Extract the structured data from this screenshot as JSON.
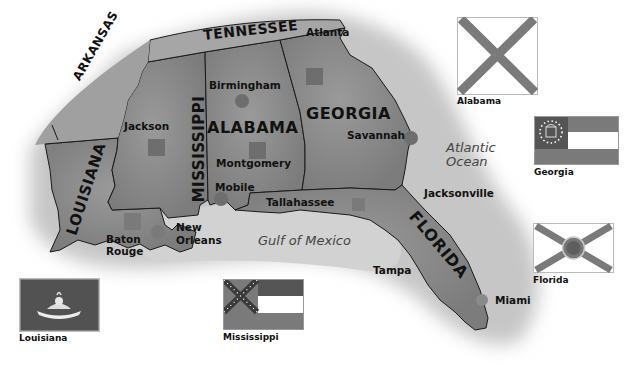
{
  "map": {
    "colors": {
      "land": "#8a8a8a",
      "land_light": "#b8b8b8",
      "border": "#1a1a1a",
      "marker": "#6e6e6e",
      "background": "#ffffff"
    },
    "states": [
      {
        "name": "TENNESSEE"
      },
      {
        "name": "ARKANSAS"
      },
      {
        "name": "MISSISSIPPI"
      },
      {
        "name": "ALABAMA"
      },
      {
        "name": "GEORGIA"
      },
      {
        "name": "LOUISIANA"
      },
      {
        "name": "FLORIDA"
      }
    ],
    "cities": [
      {
        "name": "Atlanta",
        "marker": "capital-square"
      },
      {
        "name": "Birmingham",
        "marker": "city-circle"
      },
      {
        "name": "Jackson",
        "marker": "capital-square"
      },
      {
        "name": "Savannah",
        "marker": "city-circle"
      },
      {
        "name": "Montgomery",
        "marker": "capital-square"
      },
      {
        "name": "Mobile",
        "marker": "city-circle"
      },
      {
        "name": "Tallahassee",
        "marker": "capital-square"
      },
      {
        "name": "Jacksonville",
        "marker": "none"
      },
      {
        "name": "Baton Rouge",
        "line1": "Baton",
        "line2": "Rouge",
        "marker": "capital-square"
      },
      {
        "name": "New Orleans",
        "line1": "New",
        "line2": "Orleans",
        "marker": "city-circle"
      },
      {
        "name": "Tampa",
        "marker": "none"
      },
      {
        "name": "Miami",
        "marker": "city-circle"
      }
    ],
    "water": [
      {
        "name": "Atlantic Ocean",
        "line1": "Atlantic",
        "line2": "Ocean"
      },
      {
        "name": "Gulf of Mexico"
      }
    ]
  },
  "flags": [
    {
      "state": "Alabama",
      "caption": "Alabama"
    },
    {
      "state": "Georgia",
      "caption": "Georgia"
    },
    {
      "state": "Florida",
      "caption": "Florida"
    },
    {
      "state": "Louisiana",
      "caption": "Louisiana"
    },
    {
      "state": "Mississippi",
      "caption": "Mississippi"
    }
  ]
}
